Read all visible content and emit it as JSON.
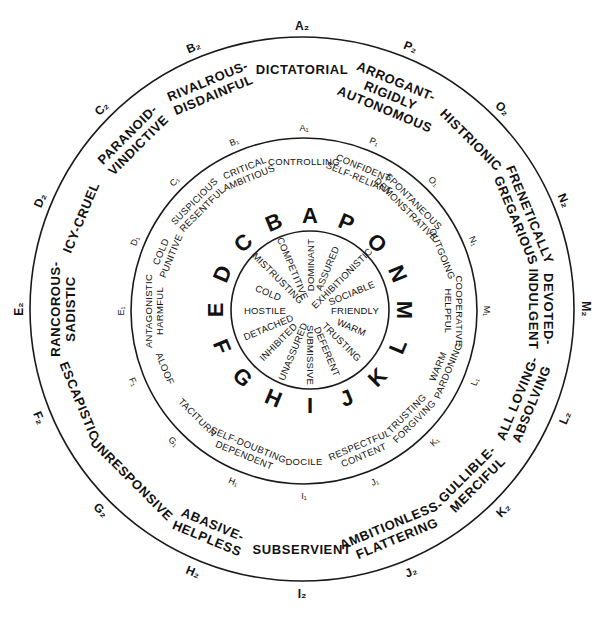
{
  "diagram": {
    "type": "interpersonal-circumplex",
    "center": [
      302,
      309
    ],
    "rings": {
      "outer_radius": 272,
      "middle_radius": 173,
      "inner_radius": 79
    },
    "inner_letters": [
      "A",
      "B",
      "C",
      "D",
      "E",
      "F",
      "G",
      "H",
      "I",
      "J",
      "K",
      "L",
      "M",
      "N",
      "O",
      "P"
    ],
    "inner_traits": [
      {
        "id": "A",
        "label": "DOMINANT"
      },
      {
        "id": "B",
        "label": "COMPETITIVE"
      },
      {
        "id": "C",
        "label": "MISTRUSTING"
      },
      {
        "id": "D",
        "label": "COLD"
      },
      {
        "id": "E",
        "label": "HOSTILE"
      },
      {
        "id": "F",
        "label": "DETACHED"
      },
      {
        "id": "G",
        "label": "INHIBITED"
      },
      {
        "id": "H",
        "label": "UNASSURED"
      },
      {
        "id": "I",
        "label": "SUBMISSIVE"
      },
      {
        "id": "J",
        "label": "DEFERENT"
      },
      {
        "id": "K",
        "label": "TRUSTING"
      },
      {
        "id": "L",
        "label": "WARM"
      },
      {
        "id": "M",
        "label": "FRIENDLY"
      },
      {
        "id": "N",
        "label": "SOCIABLE"
      },
      {
        "id": "O",
        "label": "EXHIBITIONISTIC"
      },
      {
        "id": "P",
        "label": "ASSURED"
      }
    ],
    "middle_markers": [
      "A₁",
      "B₁",
      "C₁",
      "D₁",
      "E₁",
      "F₁",
      "G₁",
      "H₁",
      "I₁",
      "J₁",
      "K₁",
      "L₁",
      "M₁",
      "N₁",
      "O₁",
      "P₁"
    ],
    "middle_traits": [
      {
        "id": "A1",
        "lines": [
          "CONTROLLING"
        ]
      },
      {
        "id": "B1",
        "lines": [
          "CRITICAL",
          "AMBITIOUS"
        ]
      },
      {
        "id": "C1",
        "lines": [
          "SUSPICIOUS",
          "RESENTFUL"
        ]
      },
      {
        "id": "D1",
        "lines": [
          "COLD",
          "PUNITIVE"
        ]
      },
      {
        "id": "E1",
        "lines": [
          "ANTAGONISTIC",
          "HARMFUL"
        ]
      },
      {
        "id": "F1",
        "lines": [
          "ALOOF"
        ]
      },
      {
        "id": "G1",
        "lines": [
          "TACITURN"
        ]
      },
      {
        "id": "H1",
        "lines": [
          "SELF-DOUBTING",
          "DEPENDENT"
        ]
      },
      {
        "id": "I1",
        "lines": [
          "DOCILE"
        ]
      },
      {
        "id": "J1",
        "lines": [
          "RESPECTFUL",
          "CONTENT"
        ]
      },
      {
        "id": "K1",
        "lines": [
          "TRUSTING",
          "FORGIVING"
        ]
      },
      {
        "id": "L1",
        "lines": [
          "WARM",
          "PARDONING"
        ]
      },
      {
        "id": "M1",
        "lines": [
          "COOPERATIVE",
          "HELPFUL"
        ]
      },
      {
        "id": "N1",
        "lines": [
          "OUTGOING"
        ]
      },
      {
        "id": "O1",
        "lines": [
          "SPONTANEOUS",
          "DEMONSTRATIVE"
        ]
      },
      {
        "id": "P1",
        "lines": [
          "CONFIDENT",
          "SELF-RELIANT"
        ]
      }
    ],
    "outer_markers": [
      "A₂",
      "B₂",
      "C₂",
      "D₂",
      "E₂",
      "F₂",
      "G₂",
      "H₂",
      "I₂",
      "J₂",
      "K₂",
      "L₂",
      "M₂",
      "N₂",
      "O₂",
      "P₂"
    ],
    "outer_traits": [
      {
        "id": "A2",
        "lines": [
          "DICTATORIAL"
        ]
      },
      {
        "id": "B2",
        "lines": [
          "RIVALROUS-",
          "DISDAINFUL"
        ]
      },
      {
        "id": "C2",
        "lines": [
          "PARANOID-",
          "VINDICTIVE"
        ]
      },
      {
        "id": "D2",
        "lines": [
          "ICY-CRUEL"
        ]
      },
      {
        "id": "E2",
        "lines": [
          "RANCOROUS-",
          "SADISTIC"
        ]
      },
      {
        "id": "F2",
        "lines": [
          "ESCAPISTIC"
        ]
      },
      {
        "id": "G2",
        "lines": [
          "UNRESPONSIVE"
        ]
      },
      {
        "id": "H2",
        "lines": [
          "ABASIVE-",
          "HELPLESS"
        ]
      },
      {
        "id": "I2",
        "lines": [
          "SUBSERVIENT"
        ]
      },
      {
        "id": "J2",
        "lines": [
          "AMBITIONLESS-",
          "FLATTERING"
        ]
      },
      {
        "id": "K2",
        "lines": [
          "GULLIBLE-",
          "MERCIFUL"
        ]
      },
      {
        "id": "L2",
        "lines": [
          "ALL LOVING-",
          "ABSOLVING"
        ]
      },
      {
        "id": "M2",
        "lines": [
          "DEVOTED-",
          "INDULGENT"
        ]
      },
      {
        "id": "N2",
        "lines": [
          "FRENETICALLY",
          "GREGARIOUS"
        ]
      },
      {
        "id": "O2",
        "lines": [
          "HISTRIONIC"
        ]
      },
      {
        "id": "P2",
        "lines": [
          "ARROGANT-",
          "RIGIDLY",
          "AUTONOMOUS"
        ]
      }
    ],
    "colors": {
      "ink": "#111111",
      "background": "#ffffff"
    }
  }
}
